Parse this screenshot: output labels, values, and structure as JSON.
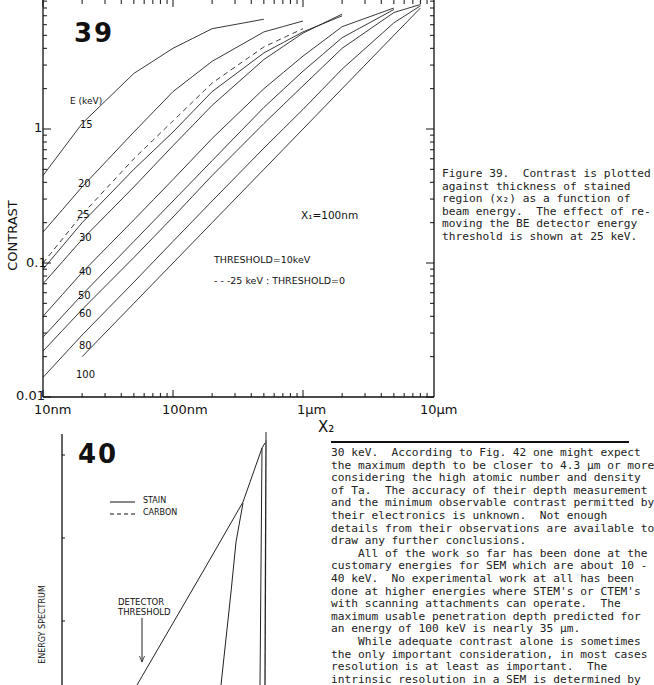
{
  "figure39": {
    "number": "39",
    "energy_header": "E (keV)",
    "annotation_x1": "X₁=100nm",
    "legend_threshold": "THRESHOLD=10keV",
    "legend_dashed": "- - -25 keV : THRESHOLD=0",
    "ylabel": "CONTRAST",
    "xlabel": "X₂",
    "yticks": [
      "1",
      "0.1",
      "0.01"
    ],
    "xticks": [
      "10nm",
      "100nm",
      "1µm",
      "10µm"
    ],
    "energy_labels": [
      "15",
      "20",
      "25",
      "30",
      "40",
      "50",
      "60",
      "80",
      "100"
    ],
    "caption_lines": [
      "Figure 39.  Contrast is plotted",
      "against thickness of stained",
      "region (x₂) as a function of",
      "beam energy.  The effect of re-",
      "moving the BE detector energy",
      "threshold is shown at 25 keV."
    ]
  },
  "figure40": {
    "number": "40",
    "legend_stain": "STAIN",
    "legend_carbon": "CARBON",
    "detector_label_1": "DETECTOR",
    "detector_label_2": "THRESHOLD",
    "ylabel": "ENERGY SPECTRUM"
  },
  "body_text_lines": [
    "30 keV.  According to Fig. 42 one might expect",
    "the maximum depth to be closer to 4.3 µm or more",
    "considering the high atomic number and density",
    "of Ta.  The accuracy of their depth measurement",
    "and the minimum observable contrast permitted by",
    "their electronics is unknown.  Not enough",
    "details from their observations are available to",
    "draw any further conclusions.",
    "    All of the work so far has been done at the",
    "customary energies for SEM which are about 10 -",
    "40 keV.  No experimental work at all has been",
    "done at higher energies where STEM's or CTEM's",
    "with scanning attachments can operate.  The",
    "maximum usable penetration depth predicted for",
    "an energy of 100 keV is nearly 35 µm.",
    "    While adequate contrast alone is sometimes",
    "the only important consideration, in most cases",
    "resolution is at least as important.  The",
    "intrinsic resolution in a SEM is determined by"
  ],
  "chart_data": [
    {
      "type": "line",
      "title": "Figure 39",
      "xlabel": "X2",
      "ylabel": "CONTRAST",
      "xscale": "log",
      "yscale": "log",
      "xlim": [
        "10nm",
        "10µm"
      ],
      "ylim": [
        0.01,
        10
      ],
      "xticks": [
        "10nm",
        "100nm",
        "1µm",
        "10µm"
      ],
      "yticks": [
        0.01,
        0.1,
        1
      ],
      "annotations": [
        "X1=100nm",
        "THRESHOLD=10keV",
        "---25 keV : THRESHOLD=0",
        "E (keV)"
      ],
      "x_nm": [
        10,
        20,
        50,
        100,
        200,
        500,
        1000,
        2000,
        5000,
        8000
      ],
      "series": [
        {
          "name": "15 keV",
          "values": [
            0.45,
            1.1,
            2.6,
            4.0,
            5.6,
            6.6,
            null,
            null,
            null,
            null
          ]
        },
        {
          "name": "20 keV",
          "values": [
            0.17,
            0.37,
            0.95,
            1.9,
            3.2,
            5.3,
            6.4,
            null,
            null,
            null
          ]
        },
        {
          "name": "25 keV",
          "values": [
            0.09,
            0.2,
            0.5,
            0.95,
            1.9,
            3.7,
            5.3,
            7.0,
            null,
            null
          ]
        },
        {
          "name": "25 keV threshold=0",
          "style": "dashed",
          "values": [
            0.1,
            0.23,
            0.6,
            1.15,
            2.2,
            4.1,
            5.6,
            null,
            null,
            null
          ]
        },
        {
          "name": "30 keV",
          "values": [
            0.07,
            0.15,
            0.37,
            0.75,
            1.5,
            3.3,
            5.2,
            7.2,
            null,
            null
          ]
        },
        {
          "name": "40 keV",
          "values": [
            0.04,
            0.085,
            0.21,
            0.42,
            0.85,
            2.0,
            3.5,
            5.8,
            8.0,
            null
          ]
        },
        {
          "name": "50 keV",
          "values": [
            0.028,
            0.058,
            0.145,
            0.29,
            0.58,
            1.45,
            2.7,
            4.8,
            7.8,
            null
          ]
        },
        {
          "name": "60 keV",
          "values": [
            0.022,
            0.045,
            0.11,
            0.22,
            0.45,
            1.1,
            2.1,
            4.0,
            7.4,
            8.5
          ]
        },
        {
          "name": "80 keV",
          "values": [
            0.014,
            0.029,
            0.072,
            0.145,
            0.29,
            0.72,
            1.4,
            2.8,
            6.2,
            8.3
          ]
        },
        {
          "name": "100 keV",
          "values": [
            null,
            0.02,
            0.05,
            0.1,
            0.2,
            0.5,
            1.0,
            2.0,
            5.0,
            8.0
          ]
        }
      ]
    },
    {
      "type": "line",
      "title": "Figure 40",
      "ylabel": "ENERGY SPECTRUM",
      "legend": [
        "STAIN (solid)",
        "CARBON (dashed)"
      ],
      "annotations": [
        "DETECTOR THRESHOLD"
      ],
      "note": "partially visible; no numeric axes shown"
    }
  ]
}
